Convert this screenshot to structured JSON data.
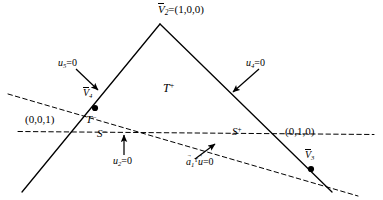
{
  "figure": {
    "kind": "geometry-diagram",
    "background_color": "#ffffff",
    "line_color": "#000000"
  },
  "labels": {
    "apex_vertex": {
      "name": "V",
      "subscript": "2",
      "equals": "=(1,0,0)",
      "full": "V̄2=(1,0,0)"
    },
    "vertex_v4": {
      "name": "V",
      "subscript": "4",
      "full": "V̄4"
    },
    "vertex_v3": {
      "name": "V",
      "subscript": "3",
      "full": "V̄3"
    },
    "constraint_u5": {
      "var": "u",
      "subscript": "5",
      "equals": "=0",
      "full": "u5=0"
    },
    "constraint_u4": {
      "var": "u",
      "subscript": "4",
      "equals": "=0",
      "full": "u4=0"
    },
    "constraint_u2": {
      "var": "u",
      "subscript": "2",
      "equals": "=0",
      "full": "u2=0"
    },
    "region_t_plus": {
      "base": "T",
      "sup": "+",
      "full": "T+"
    },
    "region_t_minus": {
      "base": "T",
      "sup": "−",
      "full": "T−"
    },
    "region_s_minus": {
      "base": "S",
      "sup": "−",
      "full": "S−"
    },
    "region_s_plus": {
      "base": "S",
      "sup": "+",
      "full": "S+"
    },
    "coord_left": "(0,0,1)",
    "coord_right": "(0,1,0)",
    "hyperplane": {
      "vec_a": "a",
      "sub_a": "1",
      "sup_T": "T",
      "vec_u": "u",
      "equals": "=0",
      "full": "a⃗1ᵀu⃗=0"
    }
  },
  "geometry": {
    "apex": {
      "x": 160,
      "y": 24
    },
    "vertex_v4": {
      "x": 95,
      "y": 108
    },
    "vertex_v3": {
      "x": 311,
      "y": 169
    },
    "left_edge": {
      "x1": 160,
      "y1": 24,
      "x2": 22,
      "y2": 192
    },
    "right_edge": {
      "x1": 160,
      "y1": 24,
      "x2": 332,
      "y2": 192
    },
    "dashed_upper": {
      "x1": 8,
      "y1": 94,
      "x2": 356,
      "y2": 196
    },
    "dashed_lower": {
      "x1": 20,
      "y1": 132,
      "x2": 372,
      "y2": 134
    },
    "arrow_u5": {
      "x1": 78,
      "y1": 70,
      "x2": 99,
      "y2": 90
    },
    "arrow_u4": {
      "x1": 258,
      "y1": 70,
      "x2": 234,
      "y2": 92
    },
    "arrow_u2": {
      "x1": 124,
      "y1": 155,
      "x2": 124,
      "y2": 136
    },
    "arrow_a1u": {
      "x1": 196,
      "y1": 158,
      "x2": 214,
      "y2": 145
    }
  }
}
